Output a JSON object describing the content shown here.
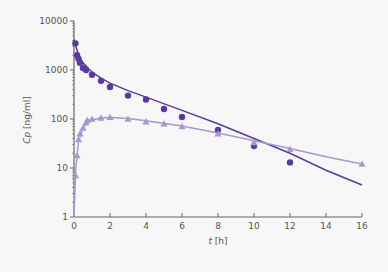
{
  "chart_data": {
    "type": "scatter",
    "title": "",
    "xlabel": "t [h]",
    "ylabel": "Cp [ng/ml]",
    "xlim": [
      0,
      16
    ],
    "ylim": [
      1,
      10000
    ],
    "yscale": "log",
    "xticks": [
      0,
      2,
      4,
      6,
      8,
      10,
      12,
      14,
      16
    ],
    "yticks": [
      1,
      10,
      100,
      1000,
      10000
    ],
    "ytick_labels": [
      "1",
      "10",
      "100",
      "1000",
      "10000"
    ],
    "grid": false,
    "legend": "none",
    "series": [
      {
        "name": "circles (i.v.)",
        "marker": "circle",
        "color": "#5b3a9a",
        "x": [
          0.08,
          0.17,
          0.25,
          0.33,
          0.5,
          0.67,
          1,
          1.5,
          2,
          3,
          4,
          5,
          6,
          8,
          10,
          12
        ],
        "y": [
          3500,
          2000,
          1700,
          1400,
          1100,
          1000,
          800,
          600,
          450,
          300,
          250,
          160,
          110,
          60,
          28,
          13
        ],
        "fit_line": {
          "x": [
            0,
            0.25,
            0.5,
            1,
            1.5,
            2,
            3,
            4,
            6,
            8,
            10,
            12,
            14,
            16
          ],
          "y": [
            4200,
            2000,
            1400,
            900,
            680,
            540,
            380,
            280,
            150,
            80,
            40,
            20,
            9,
            4.5
          ]
        }
      },
      {
        "name": "triangles (oral)",
        "marker": "triangle",
        "color": "#a898cc",
        "x": [
          0.08,
          0.17,
          0.25,
          0.33,
          0.5,
          0.67,
          0.75,
          1,
          1.5,
          2,
          3,
          4,
          5,
          6,
          8,
          10,
          12,
          16
        ],
        "y": [
          7,
          18,
          38,
          50,
          65,
          85,
          95,
          100,
          105,
          108,
          100,
          88,
          80,
          70,
          50,
          33,
          24,
          12
        ],
        "fit_line": {
          "x": [
            0,
            0.1,
            0.25,
            0.5,
            0.75,
            1,
            1.5,
            2,
            3,
            4,
            6,
            8,
            10,
            12,
            14,
            16
          ],
          "y": [
            1,
            10,
            35,
            65,
            85,
            96,
            105,
            107,
            102,
            92,
            72,
            52,
            36,
            25,
            17,
            12
          ]
        }
      }
    ]
  }
}
